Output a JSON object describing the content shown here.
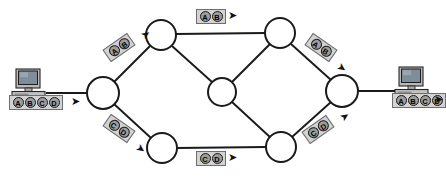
{
  "diagram": {
    "type": "network-topology",
    "background": "#ffffff",
    "line_color": "#1a1a1a",
    "node_fill": "#ffffff",
    "packet_box_fill": "#d2d2d2",
    "packet_cell_fill": "#9d9d9d"
  },
  "hosts": [
    {
      "id": "source-host",
      "name": "source-computer",
      "icon": "desktop-computer-icon",
      "x": 10,
      "y": 69,
      "label": {
        "cells": [
          "A",
          "B",
          "C",
          "D"
        ],
        "arrow": "right"
      }
    },
    {
      "id": "destination-host",
      "name": "destination-computer",
      "icon": "desktop-computer-icon",
      "x": 393,
      "y": 67,
      "label": {
        "cells": [
          "A",
          "B",
          "C",
          "D"
        ],
        "arrow": "right"
      }
    }
  ],
  "nodes": [
    {
      "id": "n-left",
      "name": "router-left",
      "cx": 103,
      "cy": 93,
      "r": 16
    },
    {
      "id": "n-top-left",
      "name": "router-top-left",
      "cx": 161,
      "cy": 35,
      "r": 15
    },
    {
      "id": "n-center",
      "name": "router-center",
      "cx": 222,
      "cy": 92,
      "r": 14
    },
    {
      "id": "n-top-right",
      "name": "router-top-right",
      "cx": 280,
      "cy": 33,
      "r": 15
    },
    {
      "id": "n-right",
      "name": "router-right",
      "cx": 342,
      "cy": 91,
      "r": 16
    },
    {
      "id": "n-bottom-left",
      "name": "router-bottom-left",
      "cx": 162,
      "cy": 148,
      "r": 15
    },
    {
      "id": "n-bottom-right",
      "name": "router-bottom-right",
      "cx": 281,
      "cy": 147,
      "r": 15
    }
  ],
  "links": [
    {
      "from": "source-host",
      "to": "n-left",
      "x1": 46,
      "y1": 93,
      "x2": 87,
      "y2": 93
    },
    {
      "from": "n-left",
      "to": "n-top-left",
      "x1": 114,
      "y1": 82,
      "x2": 150,
      "y2": 46
    },
    {
      "from": "n-left",
      "to": "n-bottom-left",
      "x1": 114,
      "y1": 104,
      "x2": 151,
      "y2": 138
    },
    {
      "from": "n-top-left",
      "to": "n-top-right",
      "x1": 176,
      "y1": 34,
      "x2": 265,
      "y2": 33
    },
    {
      "from": "n-top-left",
      "to": "n-center",
      "x1": 172,
      "y1": 46,
      "x2": 212,
      "y2": 82
    },
    {
      "from": "n-center",
      "to": "n-top-right",
      "x1": 232,
      "y1": 82,
      "x2": 270,
      "y2": 44
    },
    {
      "from": "n-center",
      "to": "n-bottom-right",
      "x1": 232,
      "y1": 102,
      "x2": 271,
      "y2": 138
    },
    {
      "from": "n-top-right",
      "to": "n-right",
      "x1": 291,
      "y1": 44,
      "x2": 331,
      "y2": 80
    },
    {
      "from": "n-bottom-left",
      "to": "n-bottom-right",
      "x1": 177,
      "y1": 148,
      "x2": 266,
      "y2": 147
    },
    {
      "from": "n-bottom-right",
      "to": "n-right",
      "x1": 292,
      "y1": 137,
      "x2": 331,
      "y2": 102
    },
    {
      "from": "n-right",
      "to": "destination-host",
      "x1": 358,
      "y1": 91,
      "x2": 398,
      "y2": 91
    }
  ],
  "packet_labels": [
    {
      "id": "pkt-upper-left",
      "name": "packet-label-ab-upper-left",
      "cells": [
        "A",
        "B"
      ],
      "x": 104,
      "y": 40,
      "rotation": -35,
      "arrow": "up-right",
      "arrow_x": 141,
      "arrow_y": 29,
      "arrow_rot": -35
    },
    {
      "id": "pkt-top",
      "name": "packet-label-ab-top",
      "cells": [
        "A",
        "B"
      ],
      "x": 196,
      "y": 9,
      "rotation": 0,
      "arrow": "right",
      "arrow_x": 228,
      "arrow_y": 10,
      "arrow_rot": 0
    },
    {
      "id": "pkt-upper-right",
      "name": "packet-label-ab-upper-right",
      "cells": [
        "A",
        "B"
      ],
      "x": 306,
      "y": 40,
      "rotation": 35,
      "arrow": "down-right",
      "arrow_x": 337,
      "arrow_y": 62,
      "arrow_rot": 35
    },
    {
      "id": "pkt-lower-left",
      "name": "packet-label-cd-lower-left",
      "cells": [
        "C",
        "D"
      ],
      "x": 104,
      "y": 121,
      "rotation": 35,
      "arrow": "down-right",
      "arrow_x": 136,
      "arrow_y": 143,
      "arrow_rot": 35
    },
    {
      "id": "pkt-bottom",
      "name": "packet-label-cd-bottom",
      "cells": [
        "C",
        "D"
      ],
      "x": 196,
      "y": 151,
      "rotation": 0,
      "arrow": "right",
      "arrow_x": 228,
      "arrow_y": 152,
      "arrow_rot": 0
    },
    {
      "id": "pkt-lower-right",
      "name": "packet-label-cd-lower-right",
      "cells": [
        "C",
        "D"
      ],
      "x": 303,
      "y": 122,
      "rotation": -35,
      "arrow": "up-right",
      "arrow_x": 340,
      "arrow_y": 111,
      "arrow_rot": -35
    }
  ]
}
